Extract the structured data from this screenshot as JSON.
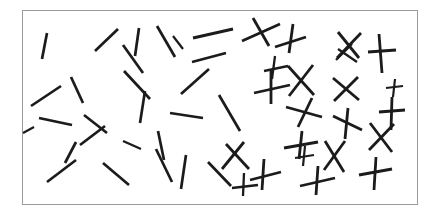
{
  "figure": {
    "width": 438,
    "height": 215,
    "background_color": "#ffffff"
  },
  "frame": {
    "x": 22,
    "y": 10,
    "width": 396,
    "height": 195,
    "border_color": "#9a9a9a",
    "border_width": 1,
    "fill_color": "#ffffff"
  },
  "style": {
    "stroke_color": "#1b1b1b",
    "stroke_width": 2.6,
    "stroke_width_thin": 2.1,
    "linecap": "butt"
  },
  "chart_data": {
    "type": "scatter",
    "xlabel": "",
    "ylabel": "",
    "xlim": [
      22,
      418
    ],
    "ylim": [
      10,
      205
    ],
    "grid": false,
    "legend": "none",
    "counts": {
      "single_lines": 27,
      "crosses": 22,
      "total_elements": 49
    },
    "annotations": [
      "Left region: isolated single oriented segments",
      "Right region: paired crossing segments forming X and + shapes"
    ],
    "elements": [
      {
        "id": "line-01",
        "kind": "single-line",
        "x1": 47,
        "y1": 33,
        "x2": 42,
        "y2": 59,
        "w": 2.7
      },
      {
        "id": "line-02",
        "kind": "single-line",
        "x1": 95,
        "y1": 51,
        "x2": 118,
        "y2": 29,
        "w": 2.7
      },
      {
        "id": "line-03",
        "kind": "single-line",
        "x1": 123,
        "y1": 45,
        "x2": 143,
        "y2": 73,
        "w": 2.7
      },
      {
        "id": "line-04",
        "kind": "single-line",
        "x1": 139,
        "y1": 28,
        "x2": 135,
        "y2": 56,
        "w": 2.7
      },
      {
        "id": "line-05",
        "kind": "single-line",
        "x1": 157,
        "y1": 26,
        "x2": 175,
        "y2": 57,
        "w": 2.7
      },
      {
        "id": "line-06",
        "kind": "single-line",
        "x1": 193,
        "y1": 38,
        "x2": 233,
        "y2": 29,
        "w": 2.9
      },
      {
        "id": "line-07",
        "kind": "single-line",
        "x1": 124,
        "y1": 71,
        "x2": 150,
        "y2": 99,
        "w": 2.7
      },
      {
        "id": "line-08",
        "kind": "single-line",
        "x1": 31,
        "y1": 106,
        "x2": 61,
        "y2": 86,
        "w": 2.7
      },
      {
        "id": "line-09",
        "kind": "single-line",
        "x1": 71,
        "y1": 77,
        "x2": 83,
        "y2": 103,
        "w": 2.7
      },
      {
        "id": "line-10",
        "kind": "single-line",
        "x1": 39,
        "y1": 118,
        "x2": 72,
        "y2": 125,
        "w": 2.7
      },
      {
        "id": "line-11",
        "kind": "single-line",
        "x1": 84,
        "y1": 115,
        "x2": 107,
        "y2": 133,
        "w": 2.7
      },
      {
        "id": "line-12",
        "kind": "single-line",
        "x1": 145,
        "y1": 91,
        "x2": 140,
        "y2": 123,
        "w": 2.7
      },
      {
        "id": "line-13",
        "kind": "single-line",
        "x1": 80,
        "y1": 145,
        "x2": 105,
        "y2": 126,
        "w": 2.7
      },
      {
        "id": "line-14",
        "kind": "single-line",
        "x1": 181,
        "y1": 94,
        "x2": 209,
        "y2": 69,
        "w": 2.7
      },
      {
        "id": "line-15",
        "kind": "single-line",
        "x1": 192,
        "y1": 62,
        "x2": 226,
        "y2": 53,
        "w": 2.7
      },
      {
        "id": "line-16",
        "kind": "single-line",
        "x1": 170,
        "y1": 113,
        "x2": 203,
        "y2": 118,
        "w": 2.7
      },
      {
        "id": "line-17",
        "kind": "single-line",
        "x1": 219,
        "y1": 95,
        "x2": 240,
        "y2": 131,
        "w": 2.7
      },
      {
        "id": "line-18",
        "kind": "single-line",
        "x1": 158,
        "y1": 131,
        "x2": 164,
        "y2": 160,
        "w": 2.7
      },
      {
        "id": "line-19",
        "kind": "single-line",
        "x1": 65,
        "y1": 163,
        "x2": 76,
        "y2": 142,
        "w": 2.7
      },
      {
        "id": "line-20",
        "kind": "single-line",
        "x1": 47,
        "y1": 182,
        "x2": 76,
        "y2": 160,
        "w": 2.7
      },
      {
        "id": "line-21",
        "kind": "single-line",
        "x1": 103,
        "y1": 163,
        "x2": 129,
        "y2": 185,
        "w": 2.7
      },
      {
        "id": "line-22",
        "kind": "single-line",
        "x1": 156,
        "y1": 149,
        "x2": 172,
        "y2": 182,
        "w": 2.7
      },
      {
        "id": "line-23",
        "kind": "single-line",
        "x1": 186,
        "y1": 155,
        "x2": 181,
        "y2": 189,
        "w": 2.7
      },
      {
        "id": "line-24",
        "kind": "single-line",
        "x1": 208,
        "y1": 162,
        "x2": 231,
        "y2": 186,
        "w": 2.7
      },
      {
        "id": "line-25",
        "kind": "single-line",
        "x1": 123,
        "y1": 141,
        "x2": 141,
        "y2": 149,
        "w": 2.4
      },
      {
        "id": "line-26",
        "kind": "single-line",
        "x1": 23,
        "y1": 133,
        "x2": 34,
        "y2": 127,
        "w": 2.2
      },
      {
        "id": "line-27",
        "kind": "single-line",
        "x1": 173,
        "y1": 36,
        "x2": 183,
        "y2": 49,
        "w": 2.2
      },
      {
        "id": "cross-01",
        "kind": "cross",
        "x1": 242,
        "y1": 41,
        "x2": 280,
        "y2": 24,
        "x3": 253,
        "y3": 18,
        "x4": 269,
        "y4": 46,
        "w": 2.8
      },
      {
        "id": "cross-02",
        "kind": "cross",
        "x1": 275,
        "y1": 47,
        "x2": 306,
        "y2": 37,
        "x3": 293,
        "y3": 24,
        "x4": 289,
        "y4": 53,
        "w": 2.8
      },
      {
        "id": "cross-03",
        "kind": "cross",
        "x1": 338,
        "y1": 32,
        "x2": 359,
        "y2": 58,
        "x3": 361,
        "y3": 33,
        "x4": 337,
        "y4": 58,
        "w": 2.8
      },
      {
        "id": "cross-04",
        "kind": "cross",
        "x1": 379,
        "y1": 34,
        "x2": 382,
        "y2": 73,
        "x3": 368,
        "y3": 52,
        "x4": 396,
        "y4": 50,
        "w": 2.8
      },
      {
        "id": "cross-05",
        "kind": "cross",
        "x1": 254,
        "y1": 93,
        "x2": 290,
        "y2": 85,
        "x3": 271,
        "y3": 70,
        "x4": 271,
        "y4": 104,
        "w": 2.8
      },
      {
        "id": "cross-06",
        "kind": "cross",
        "x1": 288,
        "y1": 66,
        "x2": 314,
        "y2": 95,
        "x3": 313,
        "y3": 65,
        "x4": 289,
        "y4": 96,
        "w": 2.8
      },
      {
        "id": "cross-07",
        "kind": "cross",
        "x1": 333,
        "y1": 78,
        "x2": 359,
        "y2": 100,
        "x3": 358,
        "y3": 77,
        "x4": 334,
        "y4": 101,
        "w": 2.8
      },
      {
        "id": "cross-08",
        "kind": "cross",
        "x1": 286,
        "y1": 107,
        "x2": 322,
        "y2": 117,
        "x3": 298,
        "y3": 127,
        "x4": 312,
        "y4": 98,
        "w": 2.8
      },
      {
        "id": "cross-09",
        "kind": "cross",
        "x1": 333,
        "y1": 116,
        "x2": 362,
        "y2": 130,
        "x3": 348,
        "y3": 108,
        "x4": 345,
        "y4": 139,
        "w": 2.8
      },
      {
        "id": "cross-10",
        "kind": "cross",
        "x1": 392,
        "y1": 97,
        "x2": 391,
        "y2": 130,
        "x3": 379,
        "y3": 112,
        "x4": 405,
        "y4": 110,
        "w": 2.8
      },
      {
        "id": "cross-11",
        "kind": "cross",
        "x1": 370,
        "y1": 123,
        "x2": 392,
        "y2": 152,
        "x3": 394,
        "y3": 124,
        "x4": 369,
        "y4": 150,
        "w": 2.8
      },
      {
        "id": "cross-12",
        "kind": "cross",
        "x1": 325,
        "y1": 141,
        "x2": 344,
        "y2": 172,
        "x3": 345,
        "y3": 141,
        "x4": 324,
        "y4": 170,
        "w": 2.8
      },
      {
        "id": "cross-13",
        "kind": "cross",
        "x1": 226,
        "y1": 144,
        "x2": 249,
        "y2": 169,
        "x3": 244,
        "y3": 142,
        "x4": 222,
        "y4": 169,
        "w": 2.8
      },
      {
        "id": "cross-14",
        "kind": "cross",
        "x1": 250,
        "y1": 180,
        "x2": 281,
        "y2": 172,
        "x3": 264,
        "y3": 159,
        "x4": 262,
        "y4": 190,
        "w": 2.8
      },
      {
        "id": "cross-15",
        "kind": "cross",
        "x1": 284,
        "y1": 148,
        "x2": 318,
        "y2": 142,
        "x3": 302,
        "y3": 131,
        "x4": 299,
        "y4": 159,
        "w": 2.8
      },
      {
        "id": "cross-16",
        "kind": "cross",
        "x1": 300,
        "y1": 186,
        "x2": 335,
        "y2": 178,
        "x3": 318,
        "y3": 166,
        "x4": 316,
        "y4": 195,
        "w": 2.8
      },
      {
        "id": "cross-17",
        "kind": "cross",
        "x1": 359,
        "y1": 175,
        "x2": 392,
        "y2": 169,
        "x3": 376,
        "y3": 157,
        "x4": 374,
        "y4": 190,
        "w": 2.8
      },
      {
        "id": "cross-18",
        "kind": "cross",
        "x1": 264,
        "y1": 71,
        "x2": 288,
        "y2": 66,
        "x3": 275,
        "y3": 56,
        "x4": 272,
        "y4": 79,
        "w": 2.3
      },
      {
        "id": "cross-19",
        "kind": "cross",
        "x1": 338,
        "y1": 49,
        "x2": 357,
        "y2": 62,
        "x3": 352,
        "y3": 44,
        "x4": 336,
        "y4": 60,
        "w": 2.3
      },
      {
        "id": "cross-20",
        "kind": "cross",
        "x1": 232,
        "y1": 188,
        "x2": 258,
        "y2": 185,
        "x3": 244,
        "y3": 173,
        "x4": 243,
        "y4": 196,
        "w": 2.3
      },
      {
        "id": "cross-21",
        "kind": "cross",
        "x1": 386,
        "y1": 88,
        "x2": 403,
        "y2": 86,
        "x3": 395,
        "y3": 79,
        "x4": 393,
        "y4": 97,
        "w": 2.2
      },
      {
        "id": "cross-22",
        "kind": "cross",
        "x1": 295,
        "y1": 158,
        "x2": 314,
        "y2": 155,
        "x3": 305,
        "y3": 146,
        "x4": 303,
        "y4": 166,
        "w": 2.2
      }
    ]
  }
}
